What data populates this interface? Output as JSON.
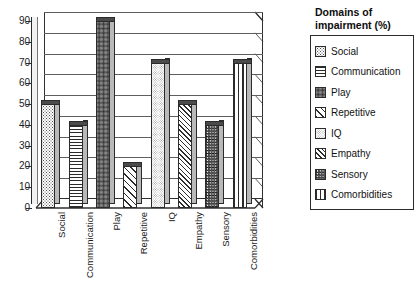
{
  "chart_data": {
    "type": "bar",
    "title": "",
    "xlabel": "",
    "ylabel": "",
    "ylim": [
      0,
      90
    ],
    "ytick_step": 10,
    "grid": true,
    "legend_position": "right",
    "legend_title": "Domains of impairment (%)",
    "categories": [
      "Social",
      "Communication",
      "Play",
      "Repetitive",
      "IQ",
      "Empathy",
      "Sensory",
      "Comorbidities"
    ],
    "values": [
      50,
      40,
      90,
      20,
      70,
      50,
      40,
      70
    ],
    "ytick_labels": [
      "0",
      "10",
      "20",
      "30",
      "40",
      "50",
      "60",
      "70",
      "80",
      "90"
    ],
    "series": [
      {
        "name": "Domains of impairment (%)",
        "values": [
          50,
          40,
          90,
          20,
          70,
          50,
          40,
          70
        ]
      }
    ],
    "patterns": [
      "light-dots",
      "horizontal-lines",
      "dense-dots",
      "forward-diagonal",
      "fine-light-dots",
      "thin-back-diagonal",
      "dense-checker",
      "vertical-lines"
    ],
    "style": "3d-column",
    "colors": {
      "bar_face": "#ffffff",
      "bar_side": "#b9b9b9",
      "bar_top": "#4a4a4a",
      "outline": "#2b2b2b",
      "gridline": "#5e5e5e",
      "background": "#ffffff"
    }
  },
  "legend": {
    "title_line1": "Domains of",
    "title_line2": "impairment (%)",
    "items": [
      {
        "label": "Social",
        "pattern": "p-social"
      },
      {
        "label": "Communication",
        "pattern": "p-communication"
      },
      {
        "label": "Play",
        "pattern": "p-play"
      },
      {
        "label": "Repetitive",
        "pattern": "p-repetitive"
      },
      {
        "label": "IQ",
        "pattern": "p-iq"
      },
      {
        "label": "Empathy",
        "pattern": "p-empathy"
      },
      {
        "label": "Sensory",
        "pattern": "p-sensory"
      },
      {
        "label": "Comorbidities",
        "pattern": "p-comorbidities"
      }
    ]
  }
}
